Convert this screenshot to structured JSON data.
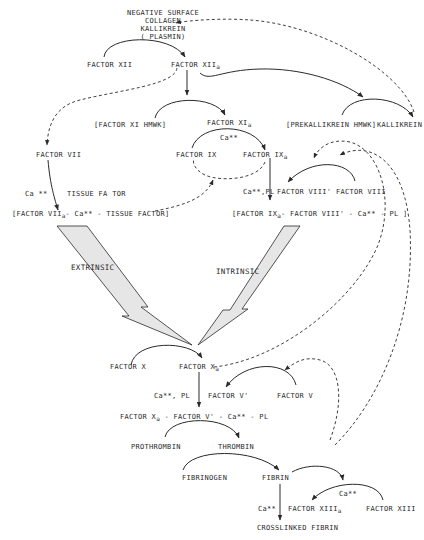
{
  "diagram": {
    "nodes": {
      "activators": [
        "NEGATIVE SURFACE",
        "COLLAGEN",
        "KALLIKREIN",
        "( PLASMIN)"
      ],
      "factor_xii": "FACTOR XII",
      "factor_xiia": "FACTOR XII",
      "factor_xiia_sub": "a",
      "factor_xi_complex": "[FACTOR XI   HMWK]",
      "factor_xia": "FACTOR XI",
      "factor_xia_sub": "a",
      "prekallikrein_complex": "[PREKALLIKREIN  HMWK]",
      "kallikrein": "KALLIKREIN",
      "factor_vii": "FACTOR VII",
      "ca_1": "Ca **",
      "tissue_factor": "TISSUE  FA TOR",
      "extrinsic_complex_pre": "[FACTOR VII",
      "extrinsic_complex_sub": "a",
      "extrinsic_complex_post": "-  Ca** - TISSUE  FACTOR]",
      "ca_2": "Ca**",
      "factor_ix": "FACTOR IX",
      "factor_ixa": "FACTOR  IX",
      "factor_ixa_sub": "a",
      "ca_pl_1": "Ca**,PL",
      "factor_viii_prime": "FACTOR VIII'",
      "factor_viii": "FACTOR VIII",
      "intrinsic_complex_pre": "[FACTOR IX",
      "intrinsic_complex_sub": "a",
      "intrinsic_complex_post": "-  FACTOR VIII'  -  Ca** - PL ]",
      "extrinsic": "EXTRINSIC",
      "intrinsic": "INTRINSIC",
      "factor_x": "FACTOR X",
      "factor_xa": "FACTOR X",
      "factor_xa_sub": "a",
      "ca_pl_2": "Ca**, PL",
      "factor_v_prime": "FACTOR V'",
      "factor_v": "FACTOR V",
      "prothrombinase_pre": "FACTOR X",
      "prothrombinase_sub": "a",
      "prothrombinase_post": " -  FACTOR V'  -  Ca** - PL",
      "prothrombin": "PROTHROMBIN",
      "thrombin": "THROMBIN",
      "fibrinogen": "FIBRINOGEN",
      "fibrin": "FIBRIN",
      "ca_3": "Ca**",
      "ca_4": "Ca**",
      "factor_xiiia": "FACTOR XIII",
      "factor_xiiia_sub": "a",
      "factor_xiii": "FACTOR XIII",
      "crosslinked_fibrin": "CROSSLINKED  FIBRIN"
    },
    "edges": [
      {
        "from": "FACTOR XII",
        "to": "FACTOR XIIa",
        "style": "solid",
        "via": "activators"
      },
      {
        "from": "FACTOR XIIa",
        "to": "FACTOR XIa",
        "style": "solid"
      },
      {
        "from": "FACTOR XIIa",
        "to": "KALLIKREIN",
        "style": "solid"
      },
      {
        "from": "KALLIKREIN",
        "to": "activators",
        "style": "dashed"
      },
      {
        "from": "FACTOR XIIa",
        "to": "FACTOR VII",
        "style": "dashed"
      },
      {
        "from": "FACTOR VII",
        "to": "FACTOR VIIa complex",
        "style": "solid"
      },
      {
        "from": "FACTOR IX",
        "to": "FACTOR IXa",
        "style": "solid",
        "via": "Ca**"
      },
      {
        "from": "FACTOR VIIa complex",
        "to": "FACTOR IX",
        "style": "dashed"
      },
      {
        "from": "FACTOR IXa",
        "to": "FACTOR IX",
        "style": "dashed"
      },
      {
        "from": "FACTOR IXa",
        "to": "intrinsic complex",
        "style": "solid"
      },
      {
        "from": "FACTOR VIII",
        "to": "FACTOR VIII'",
        "style": "solid"
      },
      {
        "from": "EXTRINSIC",
        "to": "FACTOR X",
        "style": "block-arrow"
      },
      {
        "from": "INTRINSIC",
        "to": "FACTOR X",
        "style": "block-arrow"
      },
      {
        "from": "FACTOR X",
        "to": "FACTOR Xa",
        "style": "solid"
      },
      {
        "from": "FACTOR Xa",
        "to": "FACTOR VIII",
        "style": "dashed"
      },
      {
        "from": "FACTOR Xa",
        "to": "prothrombinase",
        "style": "solid"
      },
      {
        "from": "FACTOR V",
        "to": "FACTOR V'",
        "style": "solid"
      },
      {
        "from": "PROTHROMBIN",
        "to": "THROMBIN",
        "style": "solid"
      },
      {
        "from": "THROMBIN",
        "to": "FACTOR V",
        "style": "dashed"
      },
      {
        "from": "THROMBIN",
        "to": "FACTOR VIII",
        "style": "dashed"
      },
      {
        "from": "FIBRINOGEN",
        "to": "FIBRIN",
        "style": "solid"
      },
      {
        "from": "FIBRIN",
        "to": "FACTOR XIIIa",
        "style": "solid"
      },
      {
        "from": "FACTOR XIII",
        "to": "FACTOR XIIIa",
        "style": "solid"
      },
      {
        "from": "FIBRIN",
        "to": "CROSSLINKED FIBRIN",
        "style": "solid"
      }
    ]
  }
}
